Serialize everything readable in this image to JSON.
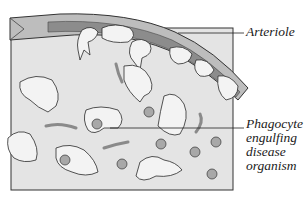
{
  "diagram": {
    "type": "biology-illustration",
    "labels": {
      "arteriole": "Arteriole",
      "phagocyte": [
        "Phagocyte",
        "engulfing",
        "disease",
        "organism"
      ]
    },
    "colors": {
      "tissue_background": "#e4e4e4",
      "vessel_wall": "#bdbdbd",
      "vessel_lumen": "#8c8c8c",
      "cell_fill": "#f3f3f3",
      "outline": "#2a2a2a",
      "bacteria_fill": "#a8a8a8",
      "arrow": "#8a8a8a"
    }
  }
}
